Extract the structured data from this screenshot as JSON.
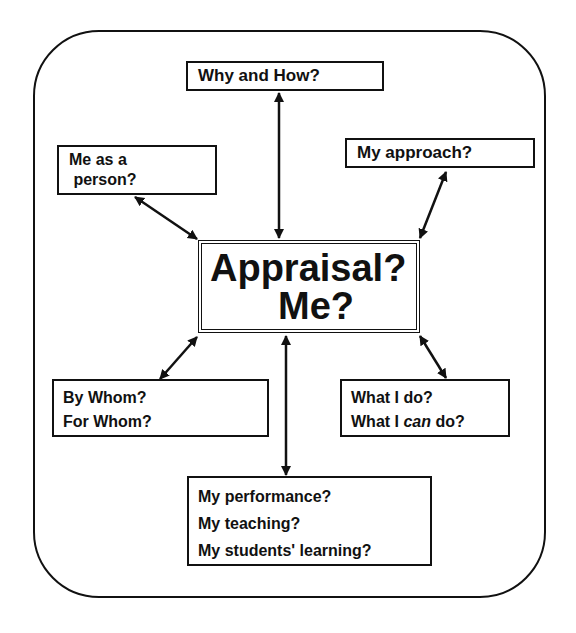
{
  "diagram": {
    "center": {
      "line1": "Appraisal?",
      "line2": "Me?"
    },
    "nodes": {
      "why_how": {
        "line1": "Why and How?"
      },
      "person": {
        "line1": "Me as a",
        "line2": " person?"
      },
      "approach": {
        "line1": "My approach?"
      },
      "whom": {
        "line1": "By Whom?",
        "line2": "For Whom?"
      },
      "do": {
        "line1": "What I do?",
        "line2_prefix": "What I ",
        "line2_italic": "can",
        "line2_suffix": " do?"
      },
      "performance": {
        "line1": "My performance?",
        "line2": "My teaching?",
        "line3": "My students' learning?"
      }
    },
    "edges": [
      {
        "from": "center",
        "to": "why_how",
        "type": "bidirectional"
      },
      {
        "from": "center",
        "to": "person",
        "type": "bidirectional"
      },
      {
        "from": "center",
        "to": "approach",
        "type": "bidirectional"
      },
      {
        "from": "center",
        "to": "whom",
        "type": "bidirectional"
      },
      {
        "from": "center",
        "to": "do",
        "type": "bidirectional"
      },
      {
        "from": "center",
        "to": "performance",
        "type": "bidirectional"
      }
    ]
  }
}
